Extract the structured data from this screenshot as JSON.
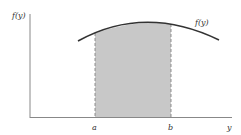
{
  "figure": {
    "y_axis_label": "f(y)",
    "curve_label": "f(y)",
    "x_axis_label": "y",
    "bound_a": "a",
    "bound_b": "b",
    "shaded_region": "area under f(y) from a to b"
  },
  "colors": {
    "axis": "#888888",
    "curve": "#333333",
    "shade": "#c8c8c8",
    "dash": "#777777"
  }
}
